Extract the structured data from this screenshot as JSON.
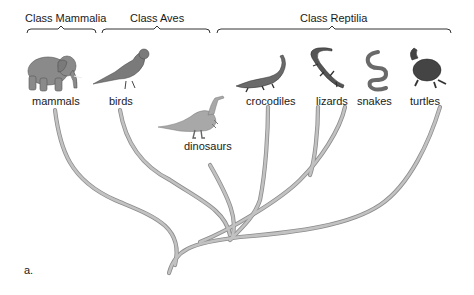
{
  "diagram": {
    "type": "phylogenetic-tree",
    "panel_label": "a.",
    "classes": [
      {
        "label": "Class Mammalia",
        "x": 25,
        "y": 12
      },
      {
        "label": "Class Aves",
        "x": 130,
        "y": 12
      },
      {
        "label": "Class Reptilia",
        "x": 300,
        "y": 12
      }
    ],
    "taxa": [
      {
        "label": "mammals",
        "icon": "elephant-icon",
        "x": 32,
        "y": 95
      },
      {
        "label": "birds",
        "icon": "bird-icon",
        "x": 109,
        "y": 95
      },
      {
        "label": "dinosaurs",
        "icon": "dinosaur-icon",
        "x": 184,
        "y": 140
      },
      {
        "label": "crocodiles",
        "icon": "crocodile-icon",
        "x": 246,
        "y": 95
      },
      {
        "label": "lizards",
        "icon": "lizard-icon",
        "x": 316,
        "y": 95
      },
      {
        "label": "snakes",
        "icon": "snake-icon",
        "x": 357,
        "y": 95
      },
      {
        "label": "turtles",
        "icon": "turtle-icon",
        "x": 410,
        "y": 95
      }
    ],
    "colors": {
      "branch": "#b3b3b3",
      "branch_edge": "#8c8c8c",
      "animal": "#7a7a7a",
      "animal_dark": "#4a4a4a",
      "bracket": "#333333"
    }
  }
}
